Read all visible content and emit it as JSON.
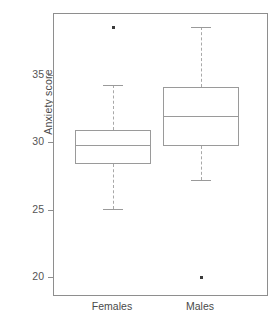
{
  "chart_data": {
    "type": "box",
    "title": "",
    "xlabel": "",
    "ylabel": "Anxiety score",
    "categories": [
      "Females",
      "Males"
    ],
    "ylim": [
      18.6,
      39.6
    ],
    "yticks": [
      20,
      25,
      30,
      35
    ],
    "ytick_labels": [
      "20",
      "25",
      "30",
      "35"
    ],
    "grid": false,
    "legend": "none",
    "frame": "box",
    "series": [
      {
        "name": "Females",
        "whisker_low": 25.1,
        "q1": 28.5,
        "median": 29.9,
        "q3": 31.0,
        "whisker_high": 34.3,
        "outliers": [
          38.6
        ]
      },
      {
        "name": "Males",
        "whisker_low": 27.3,
        "q1": 29.8,
        "median": 32.0,
        "q3": 34.2,
        "whisker_high": 38.6,
        "outliers": [
          20.05
        ]
      }
    ]
  },
  "axis": {
    "y_label": "Anxiety score",
    "y_tick_labels": [
      "35",
      "30",
      "25",
      "20"
    ],
    "x_tick_labels": [
      "Females",
      "Males"
    ]
  },
  "colors": {
    "frame": "#8e8e8e",
    "box_stroke": "#9a9a9a",
    "whisker": "#a8a8a8",
    "outlier": "#3a3a3a",
    "text": "#4a4a4a",
    "background": "#ffffff"
  }
}
